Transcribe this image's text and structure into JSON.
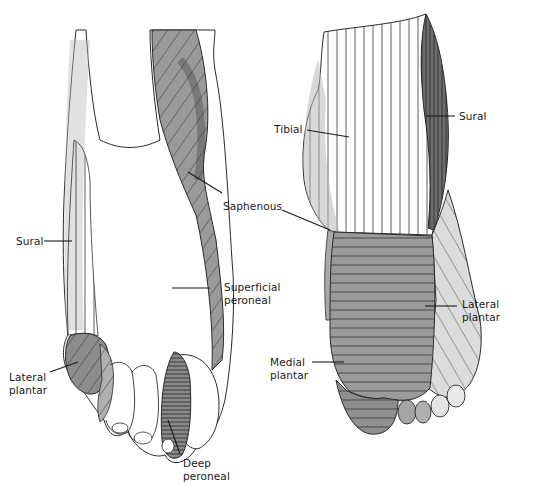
{
  "figure": {
    "views": [
      {
        "id": "dorsal",
        "regions": [
          {
            "key": "sural",
            "lines": [
              "Sural"
            ]
          },
          {
            "key": "saphenous",
            "lines": [
              "Saphenous"
            ]
          },
          {
            "key": "superficial_peroneal",
            "lines": [
              "Superficial",
              "peroneal"
            ]
          },
          {
            "key": "lateral_plantar",
            "lines": [
              "Lateral",
              "plantar"
            ]
          },
          {
            "key": "deep_peroneal",
            "lines": [
              "Deep",
              "peroneal"
            ]
          }
        ]
      },
      {
        "id": "plantar",
        "regions": [
          {
            "key": "tibial",
            "lines": [
              "Tibial"
            ]
          },
          {
            "key": "sural",
            "lines": [
              "Sural"
            ]
          },
          {
            "key": "lateral_plantar",
            "lines": [
              "Lateral",
              "plantar"
            ]
          },
          {
            "key": "medial_plantar",
            "lines": [
              "Medial",
              "plantar"
            ]
          }
        ]
      }
    ]
  },
  "colors": {
    "ink": "#1a1a1a",
    "shade_dark": "#7a7a7a",
    "shade_mid": "#9a9a9a",
    "shade_light": "#c8c8c8",
    "paper": "#ffffff"
  }
}
